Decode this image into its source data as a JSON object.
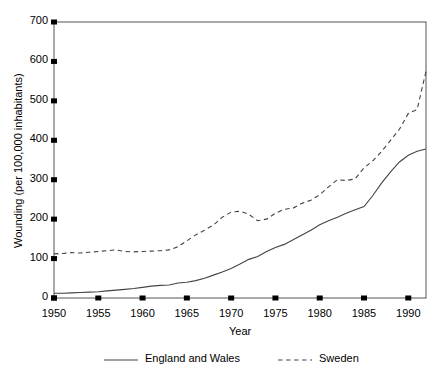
{
  "chart_data": {
    "type": "line",
    "title": "",
    "xlabel": "Year",
    "ylabel": "Wounding (per 100,000 inhabitants)",
    "xlim": [
      1950,
      1992
    ],
    "ylim": [
      0,
      700
    ],
    "ytick_labels": [
      "0",
      "100",
      "200",
      "300",
      "400",
      "500",
      "600",
      "700"
    ],
    "ytick_values": [
      0,
      100,
      200,
      300,
      400,
      500,
      600,
      700
    ],
    "xtick_labels": [
      "1950",
      "1955",
      "1960",
      "1965",
      "1970",
      "1975",
      "1980",
      "1985",
      "1990"
    ],
    "xtick_values": [
      1950,
      1955,
      1960,
      1965,
      1970,
      1975,
      1980,
      1985,
      1990
    ],
    "grid": false,
    "legend_position": "bottom",
    "x": [
      1950,
      1951,
      1952,
      1953,
      1954,
      1955,
      1956,
      1957,
      1958,
      1959,
      1960,
      1961,
      1962,
      1963,
      1964,
      1965,
      1966,
      1967,
      1968,
      1969,
      1970,
      1971,
      1972,
      1973,
      1974,
      1975,
      1976,
      1977,
      1978,
      1979,
      1980,
      1981,
      1982,
      1983,
      1984,
      1985,
      1986,
      1987,
      1988,
      1989,
      1990,
      1991,
      1992
    ],
    "series": [
      {
        "name": "England and Wales",
        "style": "solid",
        "color": "#444444",
        "values": [
          12,
          12,
          13,
          14,
          15,
          16,
          18,
          20,
          22,
          24,
          27,
          30,
          32,
          33,
          38,
          40,
          44,
          50,
          58,
          66,
          75,
          86,
          98,
          105,
          118,
          128,
          136,
          148,
          160,
          172,
          186,
          196,
          205,
          215,
          224,
          232,
          260,
          292,
          320,
          345,
          362,
          372,
          378
        ]
      },
      {
        "name": "Sweden",
        "style": "dashed",
        "color": "#444444",
        "values": [
          112,
          113,
          115,
          114,
          116,
          118,
          120,
          122,
          118,
          117,
          118,
          119,
          120,
          122,
          130,
          145,
          160,
          172,
          185,
          205,
          218,
          220,
          212,
          196,
          200,
          215,
          225,
          228,
          240,
          248,
          262,
          282,
          300,
          298,
          302,
          330,
          348,
          372,
          400,
          428,
          468,
          478,
          575
        ]
      }
    ],
    "legend": [
      {
        "label": "England and Wales",
        "style": "solid"
      },
      {
        "label": "Sweden",
        "style": "dashed"
      }
    ]
  }
}
